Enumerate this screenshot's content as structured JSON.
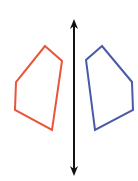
{
  "diagram": {
    "mirror_line": {
      "x": 74,
      "y1": 19,
      "y2": 176,
      "color": "#111111",
      "arrows": "both"
    },
    "shapes": [
      {
        "name": "original-pentagon",
        "color": "#e8563a",
        "points": "45,46 62,61 52,130 15,110 16,82"
      },
      {
        "name": "reflected-pentagon",
        "color": "#4a5aa8",
        "points": "102,46 86,60 95,130 133,110 132,82"
      }
    ]
  }
}
